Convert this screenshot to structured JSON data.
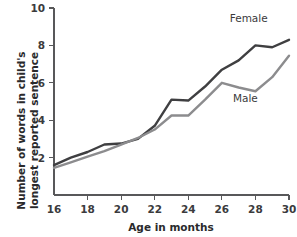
{
  "chart_data": {
    "type": "line",
    "title": "",
    "xlabel": "Age in months",
    "ylabel": "Number of words in child's\nlongest reported sentence",
    "x": [
      16,
      17,
      18,
      19,
      20,
      21,
      22,
      23,
      24,
      25,
      26,
      27,
      28,
      29,
      30
    ],
    "xlim": [
      16,
      30
    ],
    "ylim": [
      0,
      10
    ],
    "xticks": [
      16,
      18,
      20,
      22,
      24,
      26,
      28,
      30
    ],
    "xtick_labels": [
      "16",
      "18",
      "20",
      "22",
      "24",
      "26",
      "28",
      "30"
    ],
    "yticks": [
      2,
      4,
      6,
      8,
      10
    ],
    "ytick_labels": [
      "2",
      "4",
      "6",
      "8",
      "10"
    ],
    "grid": false,
    "legend_position": "inline-annotation",
    "series": [
      {
        "name": "Female",
        "color": "#3f3f41",
        "label_x": 27.6,
        "label_y": 9.25,
        "values": [
          1.6,
          2.0,
          2.3,
          2.7,
          2.75,
          3.0,
          3.7,
          5.1,
          5.05,
          5.8,
          6.7,
          7.2,
          8.0,
          7.9,
          8.3
        ]
      },
      {
        "name": "Male",
        "color": "#8c8c8e",
        "label_x": 27.4,
        "label_y": 5.0,
        "values": [
          1.45,
          1.75,
          2.05,
          2.35,
          2.7,
          3.05,
          3.5,
          4.25,
          4.25,
          5.1,
          6.0,
          5.75,
          5.55,
          6.3,
          7.45
        ]
      }
    ]
  },
  "axes": {
    "axis_color": "#58585a"
  }
}
